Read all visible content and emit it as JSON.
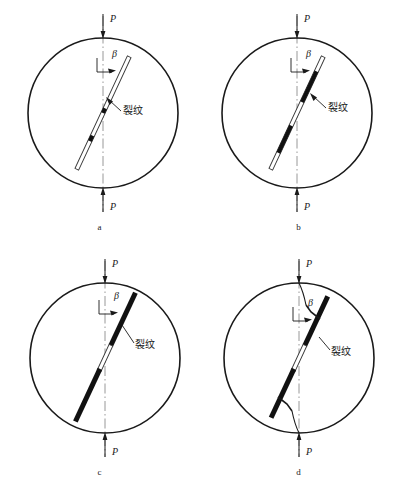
{
  "figure": {
    "background": "#ffffff",
    "stroke_color": "#1a1a1a",
    "centerline_color": "#8c8c8c",
    "crack_fill": "#111111"
  },
  "labels": {
    "load": "P",
    "angle": "β",
    "crack": "裂纹"
  },
  "panels": [
    {
      "id": "a",
      "caption": "a",
      "stage": "initial-notch",
      "load_top": "P",
      "load_bottom": "P",
      "angle_label": "β",
      "crack_label": "裂纹",
      "notch_angle_deg": 25,
      "notch_half_length": 62,
      "notch_width": 4,
      "black_segments": []
    },
    {
      "id": "b",
      "caption": "b",
      "stage": "crack-initiation",
      "load_top": "P",
      "load_bottom": "P",
      "angle_label": "β",
      "crack_label": "裂纹",
      "notch_angle_deg": 25,
      "notch_half_length": 62,
      "notch_width": 4,
      "black_segments": [
        {
          "from": -46,
          "to": -12
        },
        {
          "from": 14,
          "to": 44
        }
      ]
    },
    {
      "id": "c",
      "caption": "c",
      "stage": "crack-propagation",
      "load_top": "P",
      "load_bottom": "P",
      "angle_label": "β",
      "crack_label": "裂纹",
      "notch_angle_deg": 25,
      "notch_half_length": 62,
      "notch_width": 4,
      "black_segments": [
        {
          "from": -72,
          "to": -14
        },
        {
          "from": 12,
          "to": 70
        }
      ]
    },
    {
      "id": "d",
      "caption": "d",
      "stage": "crack-coalescence-to-loading-points",
      "load_top": "P",
      "load_bottom": "P",
      "angle_label": "β",
      "crack_label": "裂纹",
      "notch_angle_deg": 25,
      "notch_half_length": 62,
      "notch_width": 4,
      "black_segments": [
        {
          "from": -68,
          "to": -14
        },
        {
          "from": 12,
          "to": 66
        }
      ],
      "curved_tips": true
    }
  ],
  "geometry": {
    "disc_radius": 75,
    "disc_center_x": 99,
    "disc_center_y": 113
  }
}
